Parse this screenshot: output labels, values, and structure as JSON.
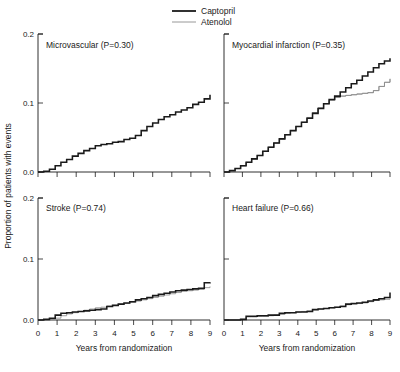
{
  "figure": {
    "legend": {
      "position": "top-center",
      "entries": [
        {
          "name": "captopril",
          "label": "Captopril",
          "color": "#1a1a1a",
          "style": "thick-solid"
        },
        {
          "name": "atenolol",
          "label": "Atenolol",
          "color": "#8d8d8d",
          "style": "thin-solid"
        }
      ]
    },
    "axis_titles": {
      "y": "Proportion of patients with events",
      "x": "Years from randomization"
    },
    "y_ticks": [
      "0.0",
      "0.1",
      "0.2"
    ],
    "x_ticks": [
      "0",
      "1",
      "2",
      "3",
      "4",
      "5",
      "6",
      "7",
      "8",
      "9"
    ]
  },
  "chart_data": [
    {
      "type": "line",
      "panel": "microvascular",
      "title": "Microvascular (P=0.30)",
      "xlabel": "Years from randomization",
      "ylabel": "Proportion of patients with events",
      "xlim": [
        0,
        9
      ],
      "ylim": [
        0,
        0.2
      ],
      "grid": false,
      "legend_position": "top-center",
      "x": [
        0,
        0.3,
        0.6,
        0.9,
        1.2,
        1.5,
        1.8,
        2.1,
        2.4,
        2.7,
        3.0,
        3.3,
        3.6,
        3.9,
        4.2,
        4.5,
        4.8,
        5.1,
        5.4,
        5.7,
        6.0,
        6.3,
        6.6,
        6.9,
        7.2,
        7.5,
        7.8,
        8.1,
        8.4,
        8.7,
        9.0
      ],
      "series": [
        {
          "name": "Captopril",
          "values": [
            0.0,
            0.001,
            0.004,
            0.009,
            0.014,
            0.018,
            0.023,
            0.027,
            0.031,
            0.034,
            0.038,
            0.04,
            0.041,
            0.043,
            0.044,
            0.047,
            0.049,
            0.053,
            0.06,
            0.066,
            0.071,
            0.076,
            0.08,
            0.083,
            0.087,
            0.09,
            0.093,
            0.098,
            0.101,
            0.106,
            0.112
          ]
        },
        {
          "name": "Atenolol",
          "values": [
            0.0,
            0.0,
            0.002,
            0.006,
            0.01,
            0.014,
            0.017,
            0.02,
            0.023,
            0.026,
            0.028,
            0.03,
            0.032,
            0.035,
            0.038,
            0.042,
            0.046,
            0.05,
            0.054,
            0.057,
            0.06,
            0.064,
            0.068,
            0.072,
            0.075,
            0.078,
            0.082,
            0.086,
            0.089,
            0.091,
            0.093
          ]
        }
      ]
    },
    {
      "type": "line",
      "panel": "myocardial-infarction",
      "title": "Myocardial infarction (P=0.35)",
      "xlabel": "Years from randomization",
      "ylabel": "Proportion of patients with events",
      "xlim": [
        0,
        9
      ],
      "ylim": [
        0,
        0.2
      ],
      "grid": false,
      "legend_position": "top-center",
      "x": [
        0,
        0.3,
        0.6,
        0.9,
        1.2,
        1.5,
        1.8,
        2.1,
        2.4,
        2.7,
        3.0,
        3.3,
        3.6,
        3.9,
        4.2,
        4.5,
        4.8,
        5.1,
        5.4,
        5.7,
        6.0,
        6.3,
        6.6,
        6.9,
        7.2,
        7.5,
        7.8,
        8.1,
        8.4,
        8.7,
        9.0
      ],
      "series": [
        {
          "name": "Captopril",
          "values": [
            0.0,
            0.002,
            0.005,
            0.009,
            0.014,
            0.019,
            0.024,
            0.03,
            0.036,
            0.042,
            0.048,
            0.054,
            0.06,
            0.066,
            0.072,
            0.078,
            0.085,
            0.092,
            0.099,
            0.105,
            0.11,
            0.116,
            0.122,
            0.128,
            0.133,
            0.139,
            0.145,
            0.151,
            0.157,
            0.161,
            0.165
          ]
        },
        {
          "name": "Atenolol",
          "values": [
            0.0,
            0.002,
            0.005,
            0.009,
            0.014,
            0.019,
            0.024,
            0.03,
            0.036,
            0.042,
            0.048,
            0.054,
            0.06,
            0.066,
            0.072,
            0.079,
            0.086,
            0.093,
            0.099,
            0.104,
            0.108,
            0.11,
            0.111,
            0.112,
            0.113,
            0.114,
            0.115,
            0.118,
            0.124,
            0.13,
            0.135
          ]
        }
      ]
    },
    {
      "type": "line",
      "panel": "stroke",
      "title": "Stroke (P=0.74)",
      "xlabel": "Years from randomization",
      "ylabel": "Proportion of patients with events",
      "xlim": [
        0,
        9
      ],
      "ylim": [
        0,
        0.2
      ],
      "grid": false,
      "legend_position": "top-center",
      "x": [
        0,
        0.3,
        0.6,
        0.9,
        1.2,
        1.5,
        1.8,
        2.1,
        2.4,
        2.7,
        3.0,
        3.3,
        3.6,
        3.9,
        4.2,
        4.5,
        4.8,
        5.1,
        5.4,
        5.7,
        6.0,
        6.3,
        6.6,
        6.9,
        7.2,
        7.5,
        7.8,
        8.1,
        8.4,
        8.7,
        9.0
      ],
      "series": [
        {
          "name": "Captopril",
          "values": [
            0.0,
            0.001,
            0.003,
            0.008,
            0.011,
            0.012,
            0.013,
            0.014,
            0.015,
            0.016,
            0.017,
            0.018,
            0.022,
            0.024,
            0.026,
            0.028,
            0.03,
            0.033,
            0.035,
            0.037,
            0.04,
            0.042,
            0.044,
            0.046,
            0.048,
            0.049,
            0.05,
            0.051,
            0.052,
            0.061,
            0.062
          ]
        },
        {
          "name": "Atenolol",
          "values": [
            0.0,
            0.0,
            0.001,
            0.003,
            0.007,
            0.01,
            0.012,
            0.014,
            0.016,
            0.018,
            0.02,
            0.021,
            0.023,
            0.024,
            0.026,
            0.027,
            0.029,
            0.031,
            0.033,
            0.035,
            0.037,
            0.039,
            0.041,
            0.043,
            0.045,
            0.047,
            0.048,
            0.049,
            0.05,
            0.053,
            0.055
          ]
        }
      ]
    },
    {
      "type": "line",
      "panel": "heart-failure",
      "title": "Heart failure (P=0.66)",
      "xlabel": "Years from randomization",
      "ylabel": "Proportion of patients with events",
      "xlim": [
        0,
        9
      ],
      "ylim": [
        0,
        0.2
      ],
      "grid": false,
      "legend_position": "top-center",
      "x": [
        0,
        0.3,
        0.6,
        0.9,
        1.2,
        1.5,
        1.8,
        2.1,
        2.4,
        2.7,
        3.0,
        3.3,
        3.6,
        3.9,
        4.2,
        4.5,
        4.8,
        5.1,
        5.4,
        5.7,
        6.0,
        6.3,
        6.6,
        6.9,
        7.2,
        7.5,
        7.8,
        8.1,
        8.4,
        8.7,
        9.0
      ],
      "series": [
        {
          "name": "Captopril",
          "values": [
            0.0,
            0.0,
            0.0,
            0.001,
            0.006,
            0.006,
            0.007,
            0.007,
            0.008,
            0.008,
            0.011,
            0.012,
            0.012,
            0.013,
            0.013,
            0.014,
            0.017,
            0.018,
            0.019,
            0.02,
            0.021,
            0.022,
            0.026,
            0.027,
            0.028,
            0.029,
            0.031,
            0.033,
            0.035,
            0.037,
            0.045
          ]
        },
        {
          "name": "Atenolol",
          "values": [
            0.0,
            0.0,
            0.0,
            0.001,
            0.005,
            0.005,
            0.006,
            0.006,
            0.007,
            0.008,
            0.009,
            0.011,
            0.012,
            0.013,
            0.014,
            0.015,
            0.017,
            0.018,
            0.019,
            0.02,
            0.021,
            0.023,
            0.025,
            0.026,
            0.027,
            0.028,
            0.03,
            0.032,
            0.033,
            0.034,
            0.035
          ]
        }
      ]
    }
  ]
}
